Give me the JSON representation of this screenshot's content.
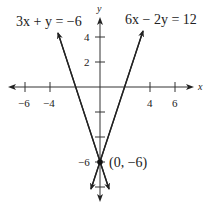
{
  "graph": {
    "type": "linear-system",
    "axes": {
      "x_label": "x",
      "y_label": "y",
      "x_ticks": [
        {
          "value": -6,
          "label": "−6"
        },
        {
          "value": -4,
          "label": "−4"
        },
        {
          "value": 4,
          "label": "4"
        },
        {
          "value": 6,
          "label": "6"
        }
      ],
      "y_ticks": [
        {
          "value": 4,
          "label": "4"
        },
        {
          "value": 2,
          "label": "2"
        },
        {
          "value": -6,
          "label": "−6"
        }
      ]
    },
    "lines": [
      {
        "equation": "3x + y = −6",
        "slope": -3,
        "intercept": -6
      },
      {
        "equation": "6x − 2y = 12",
        "slope": 3,
        "intercept": -6
      }
    ],
    "intersection": {
      "x": 0,
      "y": -6,
      "label": "(0, −6)"
    },
    "colors": {
      "line": "#222222",
      "axis": "#333333"
    }
  }
}
